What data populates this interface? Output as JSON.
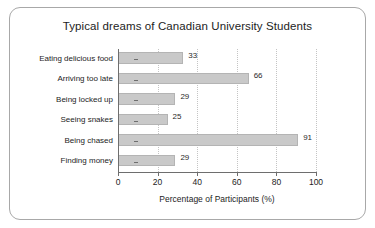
{
  "frame": {
    "border_color": "#a8a8a8",
    "background": "#ffffff"
  },
  "chart_data": {
    "type": "bar",
    "orientation": "horizontal",
    "title": "Typical dreams of Canadian University Students",
    "xlabel": "Percentage of Participants (%)",
    "ylabel": "",
    "categories": [
      "Eating delicious food",
      "Arriving too late",
      "Being locked up",
      "Seeing snakes",
      "Being chased",
      "Finding money"
    ],
    "values": [
      33,
      66,
      29,
      25,
      91,
      29
    ],
    "value_labels": [
      "33",
      "66",
      "29",
      "25",
      "91",
      "29"
    ],
    "xlim": [
      0,
      100
    ],
    "xticks": [
      0,
      20,
      40,
      60,
      80,
      100
    ],
    "xtick_labels": [
      "0",
      "20",
      "40",
      "60",
      "80",
      "100"
    ],
    "grid": true,
    "grid_axis": "x",
    "grid_style": "dotted",
    "legend": false,
    "bar_color": "#c9c9c9",
    "bar_edge_color": "#b4b4b4",
    "axis_color": "#6e6e6e",
    "text_color": "#1d1d1d"
  }
}
